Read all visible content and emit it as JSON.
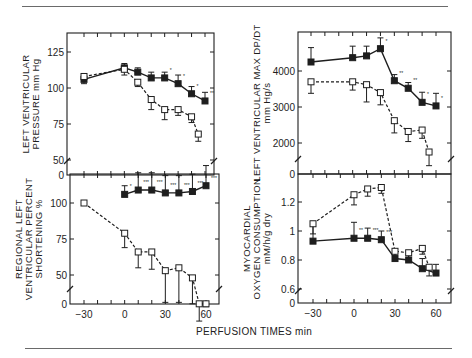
{
  "figure": {
    "xlabel": "PERFUSION TIMES min",
    "x_ticks": [
      -30,
      0,
      30,
      60
    ]
  },
  "chart_data": [
    {
      "id": "lv-pressure",
      "type": "line",
      "title": "",
      "ylabel_lines": [
        "LEFT VENTRICULAR",
        "PRESSURE mm Hg"
      ],
      "xlabel": "PERFUSION TIMES min",
      "xlim": [
        -40,
        70
      ],
      "ylim": [
        45,
        138
      ],
      "y_ticks": [
        50,
        75,
        100,
        125
      ],
      "y_zero_break": true,
      "series": [
        {
          "name": "filled squares",
          "marker": "filled-square",
          "style": "solid",
          "x": [
            -30,
            0,
            10,
            20,
            30,
            40,
            50,
            60
          ],
          "values": [
            106,
            114,
            111,
            107,
            107,
            103,
            96,
            91
          ],
          "err": [
            4,
            3,
            3,
            4,
            4,
            6,
            5,
            6
          ],
          "annotations": [
            "",
            "",
            "",
            "",
            "*",
            "*",
            "*",
            "**"
          ]
        },
        {
          "name": "open squares",
          "marker": "open-square",
          "style": "dashed",
          "x": [
            -30,
            0,
            10,
            20,
            30,
            40,
            50,
            55
          ],
          "values": [
            108,
            113,
            104,
            92,
            85,
            85,
            80,
            68
          ],
          "err": [
            5,
            4,
            3,
            7,
            7,
            4,
            4,
            5
          ],
          "annotations": []
        }
      ]
    },
    {
      "id": "lv-max-dpdt",
      "type": "line",
      "title": "",
      "ylabel_lines": [
        "LEFT VENTRICULAR MAX DP/DT",
        "mm Hg/s"
      ],
      "xlabel": "PERFUSION TIMES min",
      "xlim": [
        -40,
        70
      ],
      "ylim": [
        1200,
        5000
      ],
      "y_ticks": [
        2000,
        3000,
        4000
      ],
      "y_zero_break": true,
      "series": [
        {
          "name": "filled squares",
          "marker": "filled-square",
          "style": "solid",
          "x": [
            -30,
            0,
            10,
            20,
            30,
            40,
            50,
            60
          ],
          "values": [
            4250,
            4370,
            4420,
            4620,
            3730,
            3520,
            3130,
            3030
          ],
          "err": [
            400,
            320,
            270,
            300,
            170,
            160,
            280,
            350
          ],
          "annotations": [
            "",
            "",
            "",
            "*",
            "**",
            "**",
            "*",
            "*"
          ]
        },
        {
          "name": "open squares",
          "marker": "open-square",
          "style": "dashed",
          "x": [
            -30,
            0,
            10,
            20,
            30,
            40,
            50,
            55
          ],
          "values": [
            3700,
            3700,
            3620,
            3400,
            2620,
            2320,
            2360,
            1750
          ],
          "err": [
            320,
            230,
            480,
            340,
            340,
            280,
            230,
            380
          ],
          "annotations": []
        }
      ]
    },
    {
      "id": "regional-shortening",
      "type": "line",
      "title": "",
      "ylabel_lines": [
        "REGIONAL LEFT",
        "VENTRICULAR PERCENT",
        "SHORTENING %"
      ],
      "xlabel": "PERFUSION TIMES min",
      "xlim": [
        -40,
        70
      ],
      "ylim": [
        29,
        121
      ],
      "y_ticks": [
        50,
        75,
        100
      ],
      "y_zero_break": true,
      "series": [
        {
          "name": "filled squares",
          "marker": "filled-square",
          "style": "solid",
          "x": [
            0,
            10,
            20,
            30,
            40,
            50,
            60
          ],
          "values": [
            106,
            109,
            109,
            107,
            107,
            108,
            112
          ],
          "err": [
            6,
            12,
            12,
            12,
            12,
            12,
            14
          ],
          "annotations": [
            "*",
            "***",
            "***",
            "***",
            "***",
            "***",
            "***"
          ]
        },
        {
          "name": "open squares",
          "marker": "open-square",
          "style": "dashed",
          "x": [
            -30,
            0,
            10,
            20,
            30,
            40,
            50,
            55,
            60
          ],
          "values": [
            100,
            79,
            66,
            66,
            53,
            55,
            48,
            30,
            30
          ],
          "err": [
            0,
            10,
            11,
            12,
            22,
            24,
            18,
            12,
            2
          ],
          "annotations": []
        }
      ]
    },
    {
      "id": "myocardial-o2",
      "type": "line",
      "title": "",
      "ylabel_lines": [
        "MYOCARDIAL",
        "OXYGEN CONSUMPTION",
        "mM/h/g dry"
      ],
      "xlabel": "PERFUSION TIMES min",
      "xlim": [
        -40,
        70
      ],
      "ylim": [
        0.55,
        1.39
      ],
      "y_ticks": [
        0.6,
        0.8,
        1.0,
        1.2
      ],
      "y_zero_break": true,
      "series": [
        {
          "name": "filled squares",
          "marker": "filled-square",
          "style": "solid",
          "x": [
            -30,
            0,
            10,
            20,
            30,
            40,
            50,
            60
          ],
          "values": [
            0.93,
            0.95,
            0.95,
            0.94,
            0.81,
            0.8,
            0.74,
            0.71
          ],
          "err": [
            0.12,
            0.11,
            0.07,
            0.06,
            0.04,
            0.06,
            0.07,
            0.06
          ],
          "annotations": [
            "",
            "**",
            "***",
            "***",
            "",
            "",
            "",
            ""
          ]
        },
        {
          "name": "open squares",
          "marker": "open-square",
          "style": "dashed",
          "x": [
            -30,
            0,
            10,
            20,
            30,
            40,
            50,
            55
          ],
          "values": [
            1.05,
            1.25,
            1.29,
            1.3,
            0.86,
            0.85,
            0.88,
            0.75
          ],
          "err": [
            0.07,
            0.07,
            0.05,
            0.04,
            0.06,
            0.05,
            0.04,
            0.06
          ],
          "annotations": []
        }
      ]
    }
  ]
}
